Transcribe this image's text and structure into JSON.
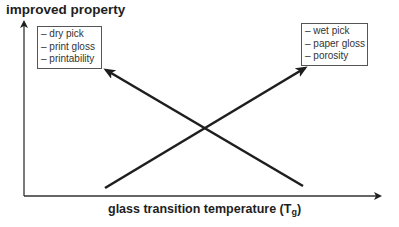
{
  "y_axis": {
    "label": "improved property"
  },
  "x_axis": {
    "label": "glass transition temperature (T",
    "label_subscript": "g",
    "label_close": ")"
  },
  "left_box": {
    "items": [
      "– dry pick",
      "– print gloss",
      "– printability"
    ]
  },
  "right_box": {
    "items": [
      "– wet pick",
      "– paper gloss",
      "– porosity"
    ]
  },
  "lines": [
    {
      "name": "decreasing-with-Tg",
      "from": [
        303,
        186
      ],
      "to": [
        104,
        69
      ],
      "points_to": "left_box"
    },
    {
      "name": "increasing-with-Tg",
      "from": [
        105,
        188
      ],
      "to": [
        307,
        67
      ],
      "points_to": "right_box"
    }
  ],
  "colors": {
    "line": "#1e1e1e",
    "box_border": "#555555",
    "text": "#333333"
  }
}
